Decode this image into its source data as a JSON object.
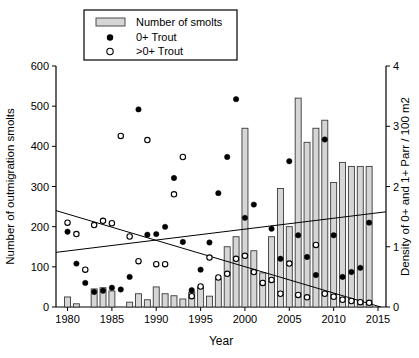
{
  "figure": {
    "legend": {
      "items": [
        {
          "label": "Number of smolts",
          "marker": "bar-swatch"
        },
        {
          "label": "0+ Trout",
          "marker": "filled-circle"
        },
        {
          "label": ">0+ Trout",
          "marker": "open-circle"
        }
      ]
    },
    "axes": {
      "x": {
        "label": "Year",
        "min": 1978.7,
        "max": 2015.9,
        "ticks": [
          1980,
          1985,
          1990,
          1995,
          2000,
          2005,
          2010,
          2015
        ]
      },
      "y_left": {
        "label": "Number of outmigration smolts",
        "min": 0,
        "max": 600,
        "ticks": [
          0,
          100,
          200,
          300,
          400,
          500,
          600
        ]
      },
      "y_right": {
        "label": "Density of 0+ and 1+ Parr / 100 m2",
        "min": 0,
        "max": 4,
        "ticks": [
          0,
          1,
          2,
          3,
          4
        ]
      }
    },
    "colors": {
      "bar_fill": "#d6d6d6",
      "bar_stroke": "#3a3a3a",
      "marker_fill": "#000000",
      "open_marker_fill": "#ffffff",
      "line": "#000000",
      "background": "#ffffff"
    }
  },
  "chart_data": {
    "type": "bar+scatter",
    "title": "",
    "xlabel": "Year",
    "ylabel_left": "Number of outmigration smolts",
    "ylabel_right": "Density of 0+ and 1+ Parr / 100 m2",
    "xlim": [
      1978.7,
      2015.9
    ],
    "ylim_left": [
      0,
      600
    ],
    "ylim_right": [
      0,
      4
    ],
    "grid": false,
    "legend_position": "top-left",
    "years": [
      1980,
      1981,
      1982,
      1983,
      1984,
      1985,
      1986,
      1987,
      1988,
      1989,
      1990,
      1991,
      1992,
      1993,
      1994,
      1995,
      1996,
      1997,
      1998,
      1999,
      2000,
      2001,
      2002,
      2003,
      2004,
      2005,
      2006,
      2007,
      2008,
      2009,
      2010,
      2011,
      2012,
      2013,
      2014
    ],
    "series": [
      {
        "name": "Number of smolts",
        "type": "bar",
        "axis": "left",
        "values": [
          25,
          8,
          null,
          45,
          48,
          40,
          null,
          12,
          33,
          18,
          50,
          33,
          28,
          20,
          37,
          50,
          27,
          70,
          150,
          175,
          445,
          140,
          85,
          175,
          295,
          200,
          520,
          410,
          445,
          465,
          310,
          360,
          350,
          350,
          350
        ]
      },
      {
        "name": "0+ Trout",
        "type": "scatter-filled",
        "axis": "right",
        "values": [
          1.25,
          0.72,
          0.4,
          0.25,
          0.27,
          0.32,
          0.29,
          0.5,
          3.28,
          1.2,
          1.21,
          1.33,
          2.14,
          1.08,
          0.28,
          0.62,
          1.07,
          1.89,
          2.49,
          3.45,
          1.48,
          1.7,
          0.4,
          1.3,
          0.8,
          2.42,
          1.19,
          0.83,
          0.53,
          2.78,
          1.19,
          0.5,
          0.58,
          0.65,
          1.4
        ]
      },
      {
        "name": ">0+ Trout",
        "type": "scatter-open",
        "axis": "right",
        "values": [
          1.4,
          1.21,
          0.62,
          1.36,
          1.43,
          1.39,
          2.84,
          1.17,
          0.76,
          2.77,
          0.71,
          0.71,
          1.87,
          2.49,
          0.18,
          0.34,
          0.82,
          0.49,
          0.55,
          0.8,
          0.85,
          0.58,
          0.4,
          0.45,
          0.22,
          0.72,
          0.2,
          0.16,
          1.03,
          0.22,
          0.17,
          0.12,
          0.1,
          0.08,
          0.07
        ]
      },
      {
        "name": "smolts-trend-line",
        "type": "line",
        "axis": "left",
        "points": [
          [
            1978.7,
            136
          ],
          [
            2015.9,
            237
          ]
        ]
      },
      {
        "name": "parr-density-trend-line",
        "type": "line",
        "axis": "right",
        "points": [
          [
            1978.7,
            1.6
          ],
          [
            2015.3,
            0.0
          ]
        ]
      }
    ]
  }
}
